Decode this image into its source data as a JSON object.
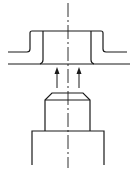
{
  "figure": {
    "stroke_color": "#1a1a1a",
    "background": "#ffffff",
    "components": [
      {
        "name": "flanged-sheet",
        "label": ""
      },
      {
        "name": "punch-head",
        "label": ""
      },
      {
        "name": "punch-base",
        "label": ""
      },
      {
        "name": "centerline",
        "label": ""
      },
      {
        "name": "motion-arrows",
        "count": 2,
        "direction": "up"
      }
    ]
  }
}
